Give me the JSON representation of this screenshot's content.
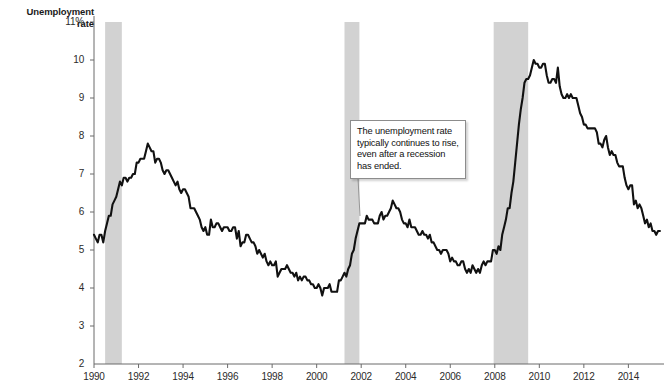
{
  "chart_data": {
    "type": "line",
    "title": "Unemployment rate",
    "ylabel": "Unemployment rate",
    "xlabel": "",
    "ylim": [
      2,
      11
    ],
    "xlim": [
      1990,
      2015.6
    ],
    "grid": false,
    "legend": "none",
    "y_unit": "%",
    "yticks": [
      {
        "value": 11,
        "label": "11%"
      },
      {
        "value": 10,
        "label": "10"
      },
      {
        "value": 9,
        "label": "9"
      },
      {
        "value": 8,
        "label": "8"
      },
      {
        "value": 7,
        "label": "7"
      },
      {
        "value": 6,
        "label": "6"
      },
      {
        "value": 5,
        "label": "5"
      },
      {
        "value": 4,
        "label": "4"
      },
      {
        "value": 3,
        "label": "3"
      },
      {
        "value": 2,
        "label": "2"
      }
    ],
    "xticks": [
      {
        "value": 1990,
        "label": "1990"
      },
      {
        "value": 1992,
        "label": "1992"
      },
      {
        "value": 1994,
        "label": "1994"
      },
      {
        "value": 1996,
        "label": "1996"
      },
      {
        "value": 1998,
        "label": "1998"
      },
      {
        "value": 2000,
        "label": "2000"
      },
      {
        "value": 2002,
        "label": "2002"
      },
      {
        "value": 2004,
        "label": "2004"
      },
      {
        "value": 2006,
        "label": "2006"
      },
      {
        "value": 2008,
        "label": "2008"
      },
      {
        "value": 2010,
        "label": "2010"
      },
      {
        "value": 2012,
        "label": "2012"
      },
      {
        "value": 2014,
        "label": "2014"
      }
    ],
    "series": [
      {
        "name": "Unemployment rate",
        "color": "#111111",
        "x": [
          1990.0,
          1990.083,
          1990.167,
          1990.25,
          1990.333,
          1990.417,
          1990.5,
          1990.583,
          1990.667,
          1990.75,
          1990.833,
          1990.917,
          1991.0,
          1991.083,
          1991.167,
          1991.25,
          1991.333,
          1991.417,
          1991.5,
          1991.583,
          1991.667,
          1991.75,
          1991.833,
          1991.917,
          1992.0,
          1992.083,
          1992.167,
          1992.25,
          1992.333,
          1992.417,
          1992.5,
          1992.583,
          1992.667,
          1992.75,
          1992.833,
          1992.917,
          1993.0,
          1993.083,
          1993.167,
          1993.25,
          1993.333,
          1993.417,
          1993.5,
          1993.583,
          1993.667,
          1993.75,
          1993.833,
          1993.917,
          1994.0,
          1994.083,
          1994.167,
          1994.25,
          1994.333,
          1994.417,
          1994.5,
          1994.583,
          1994.667,
          1994.75,
          1994.833,
          1994.917,
          1995.0,
          1995.083,
          1995.167,
          1995.25,
          1995.333,
          1995.417,
          1995.5,
          1995.583,
          1995.667,
          1995.75,
          1995.833,
          1995.917,
          1996.0,
          1996.083,
          1996.167,
          1996.25,
          1996.333,
          1996.417,
          1996.5,
          1996.583,
          1996.667,
          1996.75,
          1996.833,
          1996.917,
          1997.0,
          1997.083,
          1997.167,
          1997.25,
          1997.333,
          1997.417,
          1997.5,
          1997.583,
          1997.667,
          1997.75,
          1997.833,
          1997.917,
          1998.0,
          1998.083,
          1998.167,
          1998.25,
          1998.333,
          1998.417,
          1998.5,
          1998.583,
          1998.667,
          1998.75,
          1998.833,
          1998.917,
          1999.0,
          1999.083,
          1999.167,
          1999.25,
          1999.333,
          1999.417,
          1999.5,
          1999.583,
          1999.667,
          1999.75,
          1999.833,
          1999.917,
          2000.0,
          2000.083,
          2000.167,
          2000.25,
          2000.333,
          2000.417,
          2000.5,
          2000.583,
          2000.667,
          2000.75,
          2000.833,
          2000.917,
          2001.0,
          2001.083,
          2001.167,
          2001.25,
          2001.333,
          2001.417,
          2001.5,
          2001.583,
          2001.667,
          2001.75,
          2001.833,
          2001.917,
          2002.0,
          2002.083,
          2002.167,
          2002.25,
          2002.333,
          2002.417,
          2002.5,
          2002.583,
          2002.667,
          2002.75,
          2002.833,
          2002.917,
          2003.0,
          2003.083,
          2003.167,
          2003.25,
          2003.333,
          2003.417,
          2003.5,
          2003.583,
          2003.667,
          2003.75,
          2003.833,
          2003.917,
          2004.0,
          2004.083,
          2004.167,
          2004.25,
          2004.333,
          2004.417,
          2004.5,
          2004.583,
          2004.667,
          2004.75,
          2004.833,
          2004.917,
          2005.0,
          2005.083,
          2005.167,
          2005.25,
          2005.333,
          2005.417,
          2005.5,
          2005.583,
          2005.667,
          2005.75,
          2005.833,
          2005.917,
          2006.0,
          2006.083,
          2006.167,
          2006.25,
          2006.333,
          2006.417,
          2006.5,
          2006.583,
          2006.667,
          2006.75,
          2006.833,
          2006.917,
          2007.0,
          2007.083,
          2007.167,
          2007.25,
          2007.333,
          2007.417,
          2007.5,
          2007.583,
          2007.667,
          2007.75,
          2007.833,
          2007.917,
          2008.0,
          2008.083,
          2008.167,
          2008.25,
          2008.333,
          2008.417,
          2008.5,
          2008.583,
          2008.667,
          2008.75,
          2008.833,
          2008.917,
          2009.0,
          2009.083,
          2009.167,
          2009.25,
          2009.333,
          2009.417,
          2009.5,
          2009.583,
          2009.667,
          2009.75,
          2009.833,
          2009.917,
          2010.0,
          2010.083,
          2010.167,
          2010.25,
          2010.333,
          2010.417,
          2010.5,
          2010.583,
          2010.667,
          2010.75,
          2010.833,
          2010.917,
          2011.0,
          2011.083,
          2011.167,
          2011.25,
          2011.333,
          2011.417,
          2011.5,
          2011.583,
          2011.667,
          2011.75,
          2011.833,
          2011.917,
          2012.0,
          2012.083,
          2012.167,
          2012.25,
          2012.333,
          2012.417,
          2012.5,
          2012.583,
          2012.667,
          2012.75,
          2012.833,
          2012.917,
          2013.0,
          2013.083,
          2013.167,
          2013.25,
          2013.333,
          2013.417,
          2013.5,
          2013.583,
          2013.667,
          2013.75,
          2013.833,
          2013.917,
          2014.0,
          2014.083,
          2014.167,
          2014.25,
          2014.333,
          2014.417,
          2014.5,
          2014.583,
          2014.667,
          2014.75,
          2014.833,
          2014.917,
          2015.0,
          2015.083,
          2015.167,
          2015.25,
          2015.333,
          2015.417
        ],
        "y": [
          5.4,
          5.3,
          5.2,
          5.4,
          5.4,
          5.2,
          5.5,
          5.7,
          5.9,
          5.9,
          6.2,
          6.3,
          6.4,
          6.6,
          6.8,
          6.7,
          6.9,
          6.9,
          6.8,
          6.9,
          6.9,
          7.0,
          7.0,
          7.3,
          7.3,
          7.4,
          7.4,
          7.4,
          7.6,
          7.8,
          7.7,
          7.6,
          7.6,
          7.3,
          7.4,
          7.4,
          7.3,
          7.1,
          7.0,
          7.1,
          7.1,
          7.0,
          6.9,
          6.8,
          6.7,
          6.8,
          6.6,
          6.5,
          6.6,
          6.6,
          6.5,
          6.4,
          6.1,
          6.1,
          6.1,
          6.0,
          5.9,
          5.8,
          5.6,
          5.5,
          5.6,
          5.4,
          5.4,
          5.8,
          5.6,
          5.6,
          5.7,
          5.7,
          5.6,
          5.5,
          5.6,
          5.6,
          5.6,
          5.5,
          5.5,
          5.6,
          5.6,
          5.3,
          5.5,
          5.1,
          5.2,
          5.2,
          5.4,
          5.4,
          5.3,
          5.2,
          5.2,
          5.1,
          4.9,
          5.0,
          4.9,
          4.8,
          4.9,
          4.7,
          4.6,
          4.7,
          4.6,
          4.6,
          4.7,
          4.3,
          4.4,
          4.5,
          4.5,
          4.5,
          4.6,
          4.5,
          4.4,
          4.4,
          4.3,
          4.4,
          4.2,
          4.3,
          4.2,
          4.3,
          4.3,
          4.2,
          4.2,
          4.1,
          4.1,
          4.0,
          4.0,
          4.1,
          4.0,
          3.8,
          4.0,
          4.0,
          4.0,
          4.1,
          3.9,
          3.9,
          3.9,
          3.9,
          4.2,
          4.2,
          4.3,
          4.4,
          4.3,
          4.5,
          4.6,
          4.9,
          5.0,
          5.3,
          5.5,
          5.7,
          5.7,
          5.7,
          5.7,
          5.9,
          5.8,
          5.8,
          5.8,
          5.7,
          5.7,
          5.7,
          5.9,
          6.0,
          5.8,
          5.9,
          5.9,
          6.0,
          6.1,
          6.3,
          6.2,
          6.1,
          6.1,
          6.0,
          5.8,
          5.7,
          5.7,
          5.6,
          5.8,
          5.6,
          5.6,
          5.6,
          5.5,
          5.4,
          5.4,
          5.5,
          5.4,
          5.4,
          5.3,
          5.4,
          5.2,
          5.2,
          5.1,
          5.0,
          5.0,
          4.9,
          5.0,
          5.0,
          5.0,
          4.9,
          4.7,
          4.8,
          4.7,
          4.7,
          4.6,
          4.6,
          4.7,
          4.7,
          4.5,
          4.4,
          4.5,
          4.4,
          4.6,
          4.5,
          4.4,
          4.5,
          4.4,
          4.6,
          4.7,
          4.6,
          4.7,
          4.7,
          4.7,
          5.0,
          5.0,
          4.9,
          5.1,
          5.0,
          5.4,
          5.6,
          5.8,
          6.1,
          6.1,
          6.5,
          6.8,
          7.3,
          7.8,
          8.3,
          8.7,
          9.0,
          9.4,
          9.5,
          9.5,
          9.6,
          9.8,
          10.0,
          9.9,
          9.9,
          9.8,
          9.8,
          9.9,
          9.9,
          9.6,
          9.4,
          9.4,
          9.5,
          9.5,
          9.4,
          9.8,
          9.3,
          9.1,
          9.0,
          9.0,
          9.1,
          9.0,
          9.1,
          9.0,
          9.0,
          9.0,
          8.8,
          8.6,
          8.5,
          8.3,
          8.3,
          8.2,
          8.2,
          8.2,
          8.2,
          8.2,
          8.1,
          7.8,
          7.8,
          7.7,
          7.9,
          8.0,
          7.7,
          7.5,
          7.6,
          7.5,
          7.5,
          7.3,
          7.2,
          7.2,
          7.2,
          6.9,
          6.7,
          6.6,
          6.7,
          6.7,
          6.2,
          6.3,
          6.1,
          6.2,
          6.1,
          5.9,
          5.7,
          5.8,
          5.6,
          5.7,
          5.5,
          5.5,
          5.4,
          5.5,
          5.5
        ]
      }
    ],
    "shaded_regions": [
      {
        "name": "recession-1990-1991",
        "x0": 1990.5,
        "x1": 1991.25,
        "color": "#d2d2d2"
      },
      {
        "name": "recession-2001",
        "x0": 2001.25,
        "x1": 2001.92,
        "color": "#d2d2d2"
      },
      {
        "name": "recession-2007-2009",
        "x0": 2007.95,
        "x1": 2009.5,
        "color": "#d2d2d2"
      }
    ],
    "annotations": [
      {
        "name": "callout-recession-lag",
        "text": "The unemployment rate typically continues to rise, even after a recession has ended.",
        "box": {
          "x": 350,
          "y": 120,
          "w": 116,
          "h": 58
        },
        "leader_from": {
          "x": 358,
          "y": 178
        },
        "leader_to": {
          "x": 360,
          "y": 216
        }
      }
    ]
  },
  "axis": {
    "title_line1": "Unemployment",
    "title_line2": "rate"
  }
}
